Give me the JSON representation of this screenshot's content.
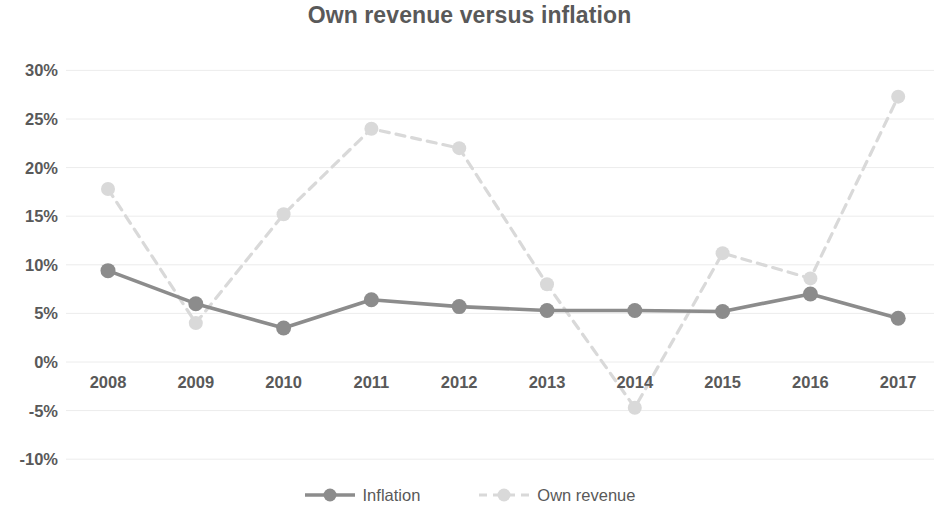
{
  "chart_data": {
    "type": "line",
    "title": "Own revenue versus inflation",
    "xlabel": "",
    "ylabel": "",
    "categories": [
      "2008",
      "2009",
      "2010",
      "2011",
      "2012",
      "2013",
      "2014",
      "2015",
      "2016",
      "2017"
    ],
    "ylim": [
      -10,
      30
    ],
    "ytick_labels": [
      "30%",
      "25%",
      "20%",
      "15%",
      "10%",
      "5%",
      "0%",
      "-5%",
      "-10%"
    ],
    "ytick_values": [
      30,
      25,
      20,
      15,
      10,
      5,
      0,
      -5,
      -10
    ],
    "grid": true,
    "grid_axis": "y",
    "legend_position": "bottom",
    "value_suffix": "%",
    "series": [
      {
        "name": "Inflation",
        "color": "#8c8c8c",
        "line_style": "solid",
        "marker": "circle",
        "values": [
          9.4,
          6.0,
          3.5,
          6.4,
          5.7,
          5.3,
          5.3,
          5.2,
          7.0,
          4.5
        ]
      },
      {
        "name": "Own revenue",
        "color": "#d9d9d9",
        "line_style": "dashed",
        "marker": "circle",
        "values": [
          17.8,
          4.0,
          15.2,
          24.0,
          22.0,
          8.0,
          -4.7,
          11.2,
          8.6,
          27.3
        ]
      }
    ]
  },
  "colors": {
    "title": "#595959",
    "axis_text": "#595959",
    "gridline": "#ececec",
    "background": "#ffffff"
  },
  "legend": {
    "entries": [
      {
        "label": "Inflation"
      },
      {
        "label": "Own revenue"
      }
    ]
  }
}
